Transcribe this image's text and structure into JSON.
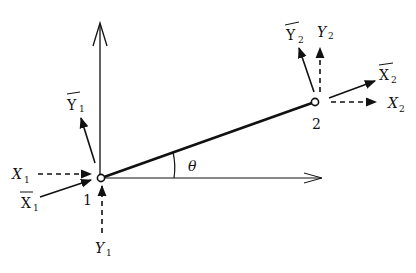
{
  "diagram": {
    "type": "beam-element-coordinate-transformation",
    "colors": {
      "ink": "#111111",
      "background": "#ffffff"
    },
    "nodes": [
      {
        "id": "node-1",
        "label": "1",
        "x": 101,
        "y": 178
      },
      {
        "id": "node-2",
        "label": "2",
        "x": 315,
        "y": 102
      }
    ],
    "angle": {
      "symbol": "θ"
    },
    "labels": {
      "X1": {
        "base": "X",
        "sub": "1",
        "overbar": false
      },
      "X1bar": {
        "base": "X",
        "sub": "1",
        "overbar": true
      },
      "Y1": {
        "base": "Y",
        "sub": "1",
        "overbar": false
      },
      "Y1bar": {
        "base": "Y",
        "sub": "1",
        "overbar": true
      },
      "X2": {
        "base": "X",
        "sub": "2",
        "overbar": false
      },
      "X2bar": {
        "base": "X",
        "sub": "2",
        "overbar": true
      },
      "Y2": {
        "base": "Y",
        "sub": "2",
        "overbar": false
      },
      "Y2bar": {
        "base": "Y",
        "sub": "2",
        "overbar": true
      }
    }
  }
}
